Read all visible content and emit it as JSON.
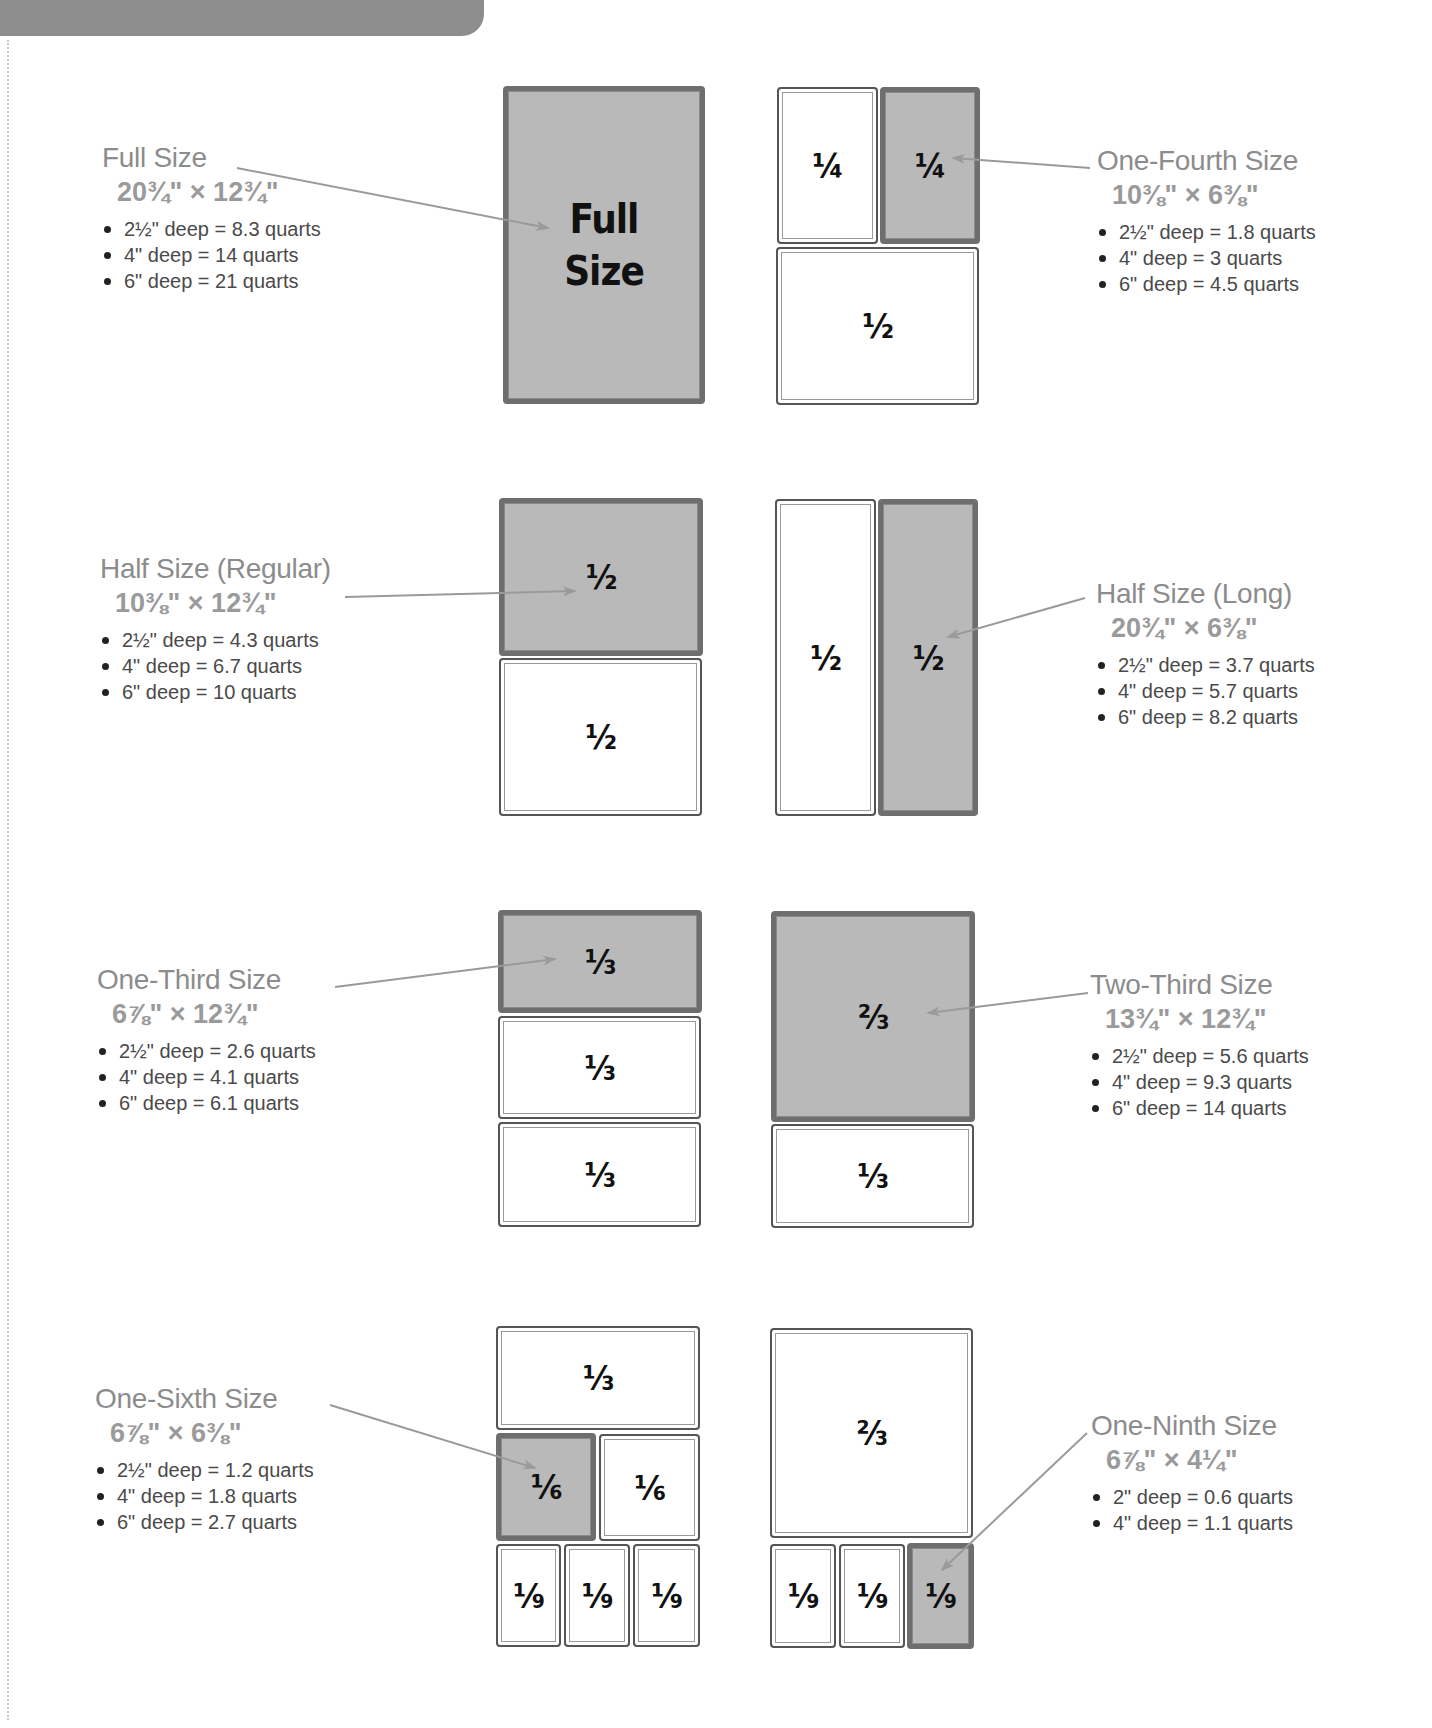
{
  "page": {
    "banner": "",
    "sections": [
      {
        "id": "full",
        "title": "Full Size",
        "dims": "20¾\" × 12¾\"",
        "bullets": [
          "2½\" deep = 8.3 quarts",
          "4\" deep = 14 quarts",
          "6\" deep = 21 quarts"
        ]
      },
      {
        "id": "one-fourth",
        "title": "One-Fourth Size",
        "dims": "10⅜\" × 6⅜\"",
        "bullets": [
          "2½\" deep = 1.8 quarts",
          "4\" deep = 3 quarts",
          "6\" deep = 4.5 quarts"
        ]
      },
      {
        "id": "half-regular",
        "title": "Half Size (Regular)",
        "dims": "10⅜\" × 12¾\"",
        "bullets": [
          "2½\" deep = 4.3 quarts",
          "4\" deep = 6.7 quarts",
          "6\" deep = 10 quarts"
        ]
      },
      {
        "id": "half-long",
        "title": "Half Size (Long)",
        "dims": "20¾\" × 6⅜\"",
        "bullets": [
          "2½\" deep = 3.7 quarts",
          "4\" deep = 5.7 quarts",
          "6\" deep = 8.2 quarts"
        ]
      },
      {
        "id": "one-third",
        "title": "One-Third Size",
        "dims": "6⅞\" × 12¾\"",
        "bullets": [
          "2½\" deep = 2.6 quarts",
          "4\" deep = 4.1 quarts",
          "6\" deep = 6.1 quarts"
        ]
      },
      {
        "id": "two-third",
        "title": "Two-Third Size",
        "dims": "13¾\" × 12¾\"",
        "bullets": [
          "2½\" deep = 5.6 quarts",
          "4\" deep = 9.3 quarts",
          "6\" deep = 14 quarts"
        ]
      },
      {
        "id": "one-sixth",
        "title": "One-Sixth Size",
        "dims": "6⅞\" × 6⅜\"",
        "bullets": [
          "2½\" deep = 1.2 quarts",
          "4\" deep = 1.8 quarts",
          "6\" deep = 2.7 quarts"
        ]
      },
      {
        "id": "one-ninth",
        "title": "One-Ninth Size",
        "dims": "6⅞\" × 4¼\"",
        "bullets": [
          "2\" deep = 0.6 quarts",
          "4\" deep = 1.1 quarts"
        ]
      }
    ],
    "pans": {
      "full": "Full\nSize",
      "quarter": "¼",
      "half": "½",
      "third": "⅓",
      "two_third": "⅔",
      "sixth": "⅙",
      "ninth": "⅑"
    },
    "colors": {
      "highlight_fill": "#b9b9b9",
      "highlight_border": "#6e6e6e",
      "title_text": "#8c8c8c",
      "arrow": "#9a9a9a",
      "banner": "#8d8d8d"
    }
  }
}
